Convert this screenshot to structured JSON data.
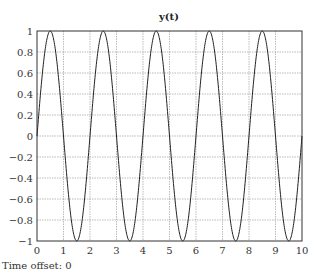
{
  "chart_data": {
    "type": "line",
    "title": "y(t)",
    "xlabel": "",
    "ylabel": "",
    "xlim": [
      0,
      10
    ],
    "ylim": [
      -1,
      1
    ],
    "xticks": [
      0,
      1,
      2,
      3,
      4,
      5,
      6,
      7,
      8,
      9,
      10
    ],
    "yticks": [
      -1,
      -0.8,
      -0.6,
      -0.4,
      -0.2,
      0,
      0.2,
      0.4,
      0.6,
      0.8,
      1
    ],
    "grid": true,
    "legend": null,
    "series": [
      {
        "name": "y(t)",
        "function": "sin(pi*t)",
        "color": "#222222",
        "x": [
          0,
          0.5,
          1,
          1.5,
          2,
          2.5,
          3,
          3.5,
          4,
          4.5,
          5,
          5.5,
          6,
          6.5,
          7,
          7.5,
          8,
          8.5,
          9,
          9.5,
          10
        ],
        "y": [
          0,
          1,
          0,
          -1,
          0,
          1,
          0,
          -1,
          0,
          1,
          0,
          -1,
          0,
          1,
          0,
          -1,
          0,
          1,
          0,
          -1,
          0
        ]
      }
    ]
  },
  "footer": {
    "label": "Time offset: 0"
  }
}
